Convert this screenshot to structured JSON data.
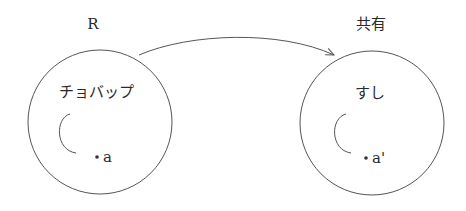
{
  "diagram": {
    "left": {
      "title": "R",
      "inner_label": "チョバップ",
      "point_label": "a"
    },
    "right": {
      "title": "共有",
      "inner_label": "すし",
      "point_label": "a'"
    },
    "arrow": {
      "from": "left",
      "to": "right"
    },
    "colors": {
      "stroke": "#555555",
      "text": "#2a2a2a",
      "background": "#ffffff"
    }
  }
}
